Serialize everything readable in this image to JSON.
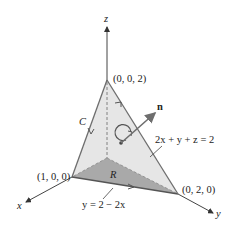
{
  "figure": {
    "axes": {
      "x_label": "x",
      "y_label": "y",
      "z_label": "z"
    },
    "points": {
      "apex": "(0, 0, 2)",
      "x_intercept": "(1, 0, 0)",
      "y_intercept": "(0, 2, 0)"
    },
    "curve_label": "C",
    "region_label": "R",
    "normal_label": "n",
    "plane_equation": "2x + y + z = 2",
    "boundary_line_equation": "y = 2 − 2x",
    "colors": {
      "plane_fill": "#e6e6e6",
      "region_fill": "#a9a9a9",
      "edge": "#6e6e6e",
      "axis": "#444444",
      "normal_arrow": "#6e6e6e"
    }
  }
}
